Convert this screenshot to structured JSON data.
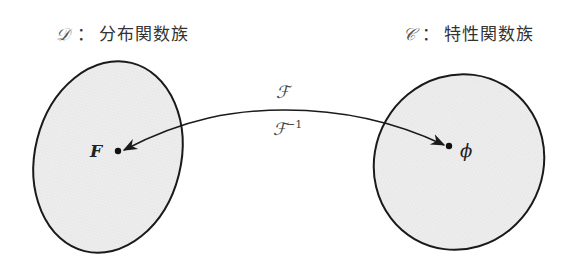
{
  "domain_sets": {
    "left": {
      "symbol": "𝒟",
      "colon": "：",
      "name": "分布関数族"
    },
    "right": {
      "symbol": "𝒞",
      "colon": "：",
      "name": "特性関数族"
    }
  },
  "points": {
    "left": "F",
    "right": "ϕ"
  },
  "mapping": {
    "forward": "ℱ",
    "inverse_base": "ℱ",
    "inverse_exp": "−1"
  },
  "colors": {
    "fill": "#ededed",
    "stroke": "#1a1a1a",
    "text": "#333333"
  }
}
